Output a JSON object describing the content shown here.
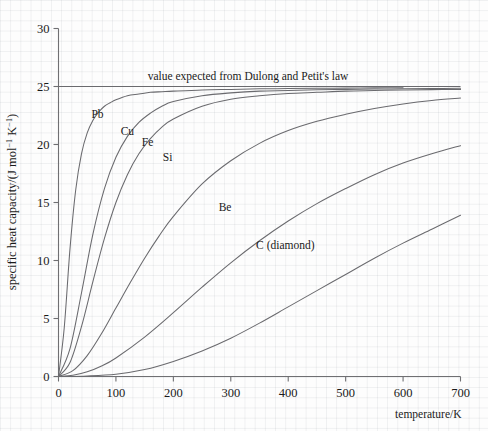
{
  "chart_data": {
    "type": "line",
    "title": "",
    "xlabel": "temperature/K",
    "ylabel": "specific heat capacity/(J mol⁻¹ K⁻¹)",
    "ylabel_parts": {
      "pre": "specific heat capacity/(J mol",
      "sup1": "−1",
      "mid": " K",
      "sup2": "−1",
      "post": ")"
    },
    "xlim": [
      0,
      700
    ],
    "ylim": [
      0,
      30
    ],
    "xticks": [
      0,
      100,
      200,
      300,
      400,
      500,
      600,
      700
    ],
    "yticks": [
      0,
      5,
      10,
      15,
      20,
      25,
      30
    ],
    "xticklabels": [
      "0",
      "100",
      "200",
      "300",
      "400",
      "500",
      "600",
      "700"
    ],
    "yticklabels": [
      "0",
      "5",
      "10",
      "15",
      "20",
      "25",
      "30"
    ],
    "grid": "faint-square-background",
    "legend": "inline-curve-labels",
    "annotations": [
      {
        "name": "dulong-petit-note",
        "text": "value expected from Dulong and Petit's law",
        "x": 330,
        "y": 25.6
      }
    ],
    "reference_lines": [
      {
        "name": "dulong-petit-line",
        "orientation": "horizontal",
        "value": 25.0,
        "x_start": 0,
        "x_end": 700
      }
    ],
    "series": [
      {
        "name": "Pb",
        "label": "Pb",
        "label_x": 68,
        "label_y": 22.3,
        "debye_temperature_K": 95,
        "x": [
          0,
          10,
          20,
          30,
          40,
          50,
          60,
          70,
          80,
          90,
          100,
          120,
          140,
          160,
          180,
          200,
          250,
          300,
          350,
          400,
          450,
          500,
          550,
          600
        ],
        "y": [
          0.0,
          4.2,
          11.0,
          16.1,
          19.2,
          21.0,
          22.1,
          22.8,
          23.3,
          23.6,
          23.85,
          24.2,
          24.35,
          24.5,
          24.55,
          24.6,
          24.7,
          24.75,
          24.8,
          24.82,
          24.85,
          24.86,
          24.88,
          24.9
        ]
      },
      {
        "name": "Cu",
        "label": "Cu",
        "label_x": 120,
        "label_y": 20.8,
        "debye_temperature_K": 170,
        "x": [
          0,
          20,
          40,
          60,
          80,
          100,
          120,
          140,
          160,
          180,
          200,
          250,
          300,
          350,
          400,
          450,
          500,
          550,
          600,
          650,
          700
        ],
        "y": [
          0.0,
          2.4,
          7.2,
          12.3,
          16.2,
          18.9,
          20.7,
          21.9,
          22.7,
          23.3,
          23.7,
          24.2,
          24.45,
          24.6,
          24.65,
          24.72,
          24.75,
          24.78,
          24.8,
          24.82,
          24.85
        ]
      },
      {
        "name": "Fe",
        "label": "Fe",
        "label_x": 155,
        "label_y": 19.9,
        "debye_temperature_K": 215,
        "x": [
          0,
          20,
          40,
          60,
          80,
          100,
          120,
          140,
          160,
          180,
          200,
          250,
          300,
          350,
          400,
          450,
          500,
          550,
          600,
          650,
          700
        ],
        "y": [
          0.0,
          1.2,
          4.3,
          8.2,
          11.9,
          15.0,
          17.4,
          19.2,
          20.5,
          21.5,
          22.2,
          23.3,
          23.9,
          24.2,
          24.4,
          24.5,
          24.6,
          24.65,
          24.7,
          24.73,
          24.75
        ]
      },
      {
        "name": "Si",
        "label": "Si",
        "label_x": 190,
        "label_y": 18.6,
        "debye_temperature_K": 420,
        "x": [
          0,
          25,
          50,
          75,
          100,
          125,
          150,
          175,
          200,
          250,
          300,
          350,
          400,
          450,
          500,
          550,
          600,
          650,
          700
        ],
        "y": [
          0.0,
          0.5,
          1.8,
          3.7,
          5.9,
          8.1,
          10.2,
          12.1,
          13.8,
          16.6,
          18.6,
          20.1,
          21.2,
          22.0,
          22.6,
          23.1,
          23.5,
          23.8,
          24.0
        ]
      },
      {
        "name": "Be",
        "label": "Be",
        "label_x": 290,
        "label_y": 14.3,
        "debye_temperature_K": 690,
        "x": [
          0,
          25,
          50,
          75,
          100,
          150,
          200,
          250,
          300,
          350,
          400,
          450,
          500,
          550,
          600,
          650,
          700
        ],
        "y": [
          0.0,
          0.1,
          0.4,
          0.9,
          1.6,
          3.4,
          5.5,
          7.7,
          9.8,
          11.7,
          13.4,
          14.9,
          16.2,
          17.4,
          18.4,
          19.2,
          19.9
        ]
      },
      {
        "name": "C (diamond)",
        "label": "C (diamond)",
        "label_x": 395,
        "label_y": 11.0,
        "debye_temperature_K": 1860,
        "x": [
          0,
          50,
          100,
          150,
          200,
          250,
          300,
          350,
          400,
          450,
          500,
          550,
          600,
          650,
          700
        ],
        "y": [
          0.0,
          0.05,
          0.2,
          0.6,
          1.3,
          2.2,
          3.3,
          4.6,
          6.0,
          7.4,
          8.8,
          10.2,
          11.5,
          12.7,
          13.9
        ]
      }
    ]
  }
}
